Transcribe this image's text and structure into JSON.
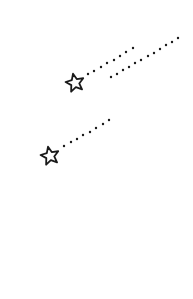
{
  "illustration": {
    "subject": "shooting stars",
    "background": "#ffffff",
    "ink": "#1a1a1a",
    "stars": [
      {
        "name": "shooting-star-1",
        "cx": 75,
        "cy": 83,
        "r": 9.5,
        "rotation": -12
      },
      {
        "name": "shooting-star-2",
        "cx": 50,
        "cy": 156,
        "r": 9.5,
        "rotation": -12
      }
    ],
    "trails": [
      {
        "name": "trail-star-1-upper",
        "dots": [
          [
            88,
            74
          ],
          [
            94,
            71
          ],
          [
            101,
            67
          ],
          [
            107,
            63
          ],
          [
            114,
            60
          ],
          [
            120,
            56
          ],
          [
            126,
            52
          ],
          [
            133,
            48
          ]
        ]
      },
      {
        "name": "trail-star-1-lower",
        "dots": [
          [
            111,
            77
          ],
          [
            117,
            74
          ],
          [
            123,
            70
          ],
          [
            129,
            67
          ],
          [
            135,
            63
          ],
          [
            141,
            60
          ],
          [
            148,
            56
          ],
          [
            154,
            53
          ],
          [
            160,
            49
          ],
          [
            166,
            45
          ],
          [
            172,
            42
          ],
          [
            178,
            38
          ]
        ]
      },
      {
        "name": "trail-star-2",
        "dots": [
          [
            64,
            146
          ],
          [
            71,
            142
          ],
          [
            77,
            139
          ],
          [
            83,
            135
          ],
          [
            90,
            132
          ],
          [
            96,
            128
          ],
          [
            103,
            124
          ],
          [
            109,
            120
          ]
        ]
      }
    ],
    "dot_radius": 1.2
  }
}
